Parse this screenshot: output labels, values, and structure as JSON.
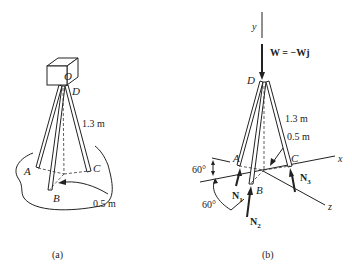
{
  "figure_a": {
    "caption": "(a)",
    "labels": {
      "camera": "O",
      "top": "D",
      "A": "A",
      "B": "B",
      "C": "C",
      "leg_length": "1.3 m",
      "base_radius": "0.5 m"
    }
  },
  "figure_b": {
    "caption": "(b)",
    "labels": {
      "y_axis": "y",
      "x_axis": "x",
      "z_axis": "z",
      "weight": "W = −Wj",
      "top": "D",
      "A": "A",
      "B": "B",
      "C": "C",
      "leg_length": "1.3 m",
      "base_radius": "0.5 m",
      "angle_1": "60°",
      "angle_2": "60°",
      "N1": "N",
      "N1_sub": "1",
      "N2": "N",
      "N2_sub": "2",
      "N3": "N",
      "N3_sub": "3"
    }
  }
}
